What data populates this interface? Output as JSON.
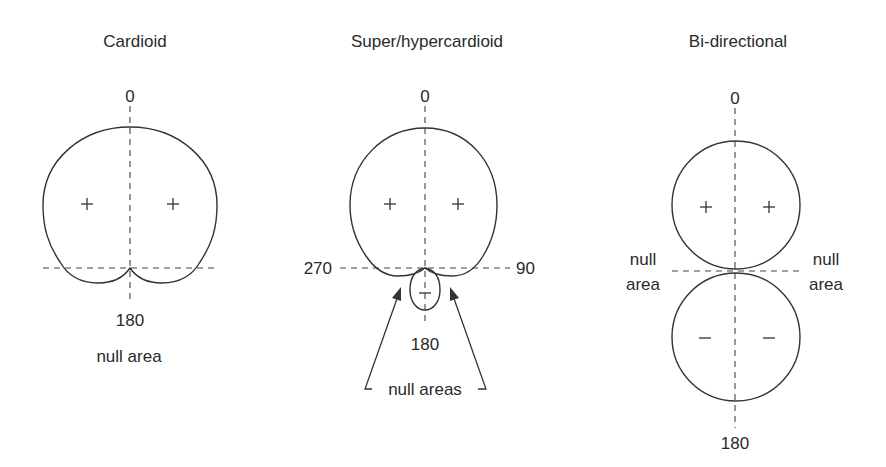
{
  "diagrams": [
    {
      "title": "Cardioid",
      "labels": {
        "top": "0",
        "bottom": "180",
        "note": "null area"
      },
      "lobe_signs": [
        "+",
        "+"
      ]
    },
    {
      "title": "Super/hypercardioid",
      "labels": {
        "top": "0",
        "bottom": "180",
        "left": "270",
        "right": "90",
        "note": "null areas"
      },
      "lobe_signs": [
        "+",
        "+"
      ],
      "rear_lobe_sign": "−"
    },
    {
      "title": "Bi-directional",
      "labels": {
        "top": "0",
        "bottom": "180",
        "left_note_1": "null",
        "left_note_2": "area",
        "right_note_1": "null",
        "right_note_2": "area"
      },
      "lobe_signs": [
        "+",
        "+"
      ],
      "rear_lobe_signs": [
        "−",
        "−"
      ]
    }
  ]
}
